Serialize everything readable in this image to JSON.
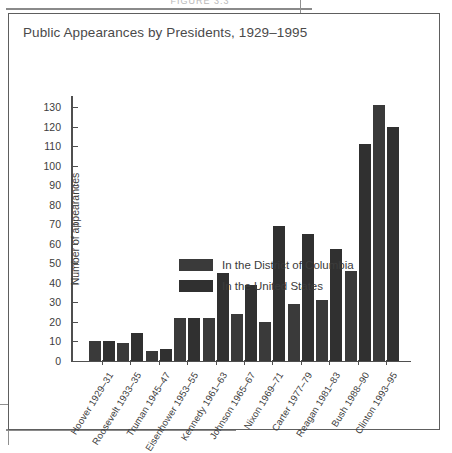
{
  "page": {
    "figure_caption": "FIGURE 3.3"
  },
  "figure": {
    "title": "Public Appearances by Presidents, 1929–1995"
  },
  "chart_data": {
    "type": "bar",
    "title": "Public Appearances by Presidents, 1929–1995",
    "xlabel": "",
    "ylabel": "Number of appearances",
    "ylim": [
      0,
      135
    ],
    "yticks": [
      0,
      10,
      20,
      30,
      40,
      50,
      60,
      70,
      80,
      90,
      100,
      110,
      120,
      130
    ],
    "grid": false,
    "legend_position": "inside-upper-left",
    "categories": [
      "Hoover 1929–31",
      "Roosevelt 1933–35",
      "Truman 1945–47",
      "Eisenhower 1953–55",
      "Kennedy 1961–63",
      "Johnson 1965–67",
      "Nixon 1969–71",
      "Carter 1977–79",
      "Reagan 1981–83",
      "Bush 1988–90",
      "Clinton 1993–95"
    ],
    "series": [
      {
        "name": "In the District of Columbia",
        "color": "#3a3a3a",
        "values": [
          10,
          9,
          5,
          22,
          22,
          24,
          20,
          29,
          31,
          46,
          131
        ]
      },
      {
        "name": "In the United States",
        "color": "#303030",
        "values": [
          10,
          14,
          6,
          22,
          45,
          39,
          69,
          65,
          57,
          111,
          120
        ]
      }
    ]
  }
}
